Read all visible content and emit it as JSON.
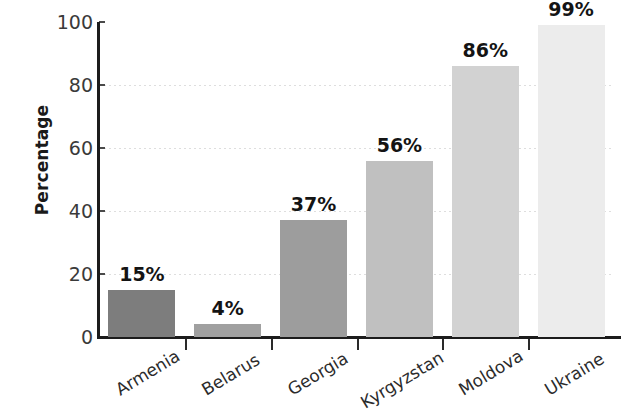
{
  "chart_data": {
    "type": "bar",
    "title": "",
    "xlabel": "",
    "ylabel": "Percentage",
    "ylim": [
      0,
      100
    ],
    "grid": true,
    "legend": "none",
    "categories": [
      "Armenia",
      "Belarus",
      "Georgia",
      "Kyrgyzstan",
      "Moldova",
      "Ukraine"
    ],
    "values": [
      15,
      4,
      37,
      56,
      86,
      99
    ],
    "data_labels": [
      "15%",
      "4%",
      "37%",
      "56%",
      "86%",
      "99%"
    ],
    "y_ticks": [
      0,
      20,
      40,
      60,
      80,
      100
    ],
    "y_tick_labels": [
      "0",
      "20",
      "40",
      "60",
      "80",
      "100"
    ],
    "bar_colors": [
      "#7d7d7d",
      "#a0a0a0",
      "#9d9d9d",
      "#c0c0c0",
      "#d2d2d2",
      "#ececec"
    ],
    "axis_color": "#1c1c1c",
    "gridline_color": "#d8d8d8",
    "label_text_color": "#141414"
  },
  "axis": {
    "y_title": "Percentage"
  }
}
